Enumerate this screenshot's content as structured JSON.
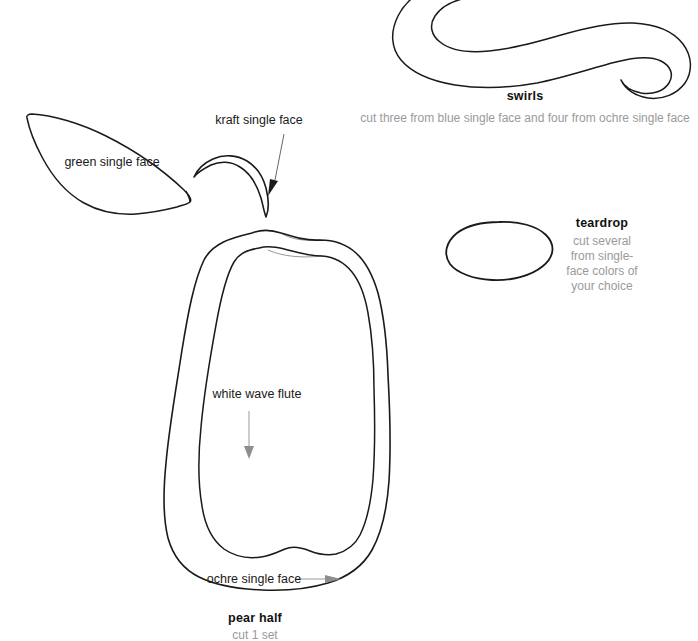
{
  "page": {
    "background_color": "#ffffff",
    "ink_color": "#1a1a1a",
    "muted_text_color": "#9a9a9a",
    "width": 698,
    "height": 641
  },
  "shapes": [
    {
      "name": "leaf",
      "label": "green single face",
      "material_color_word": "green"
    },
    {
      "name": "stem",
      "label": "kraft single face",
      "material_color_word": "kraft"
    },
    {
      "name": "pear-outer",
      "label": "ochre single face",
      "material_color_word": "ochre"
    },
    {
      "name": "pear-inner",
      "label": "white wave flute",
      "material_color_word": "white"
    },
    {
      "name": "swirl",
      "label": "swirls",
      "material_color_word": "blue"
    },
    {
      "name": "teardrop",
      "label": "teardrop",
      "material_color_word": "assorted"
    }
  ],
  "labels": {
    "leaf": "green single face",
    "stem": "kraft single face",
    "inner_flute": "white wave flute",
    "outer_face": "ochre single face"
  },
  "captions": {
    "pear": {
      "title": "pear half",
      "sub": "cut 1 set"
    },
    "swirls": {
      "title": "swirls",
      "sub": "cut three from blue single face and four from ochre single face"
    },
    "teardrop": {
      "title": "teardrop",
      "sub_line1": "cut several",
      "sub_line2": "from single-",
      "sub_line3": "face colors of",
      "sub_line4": "your choice"
    }
  }
}
